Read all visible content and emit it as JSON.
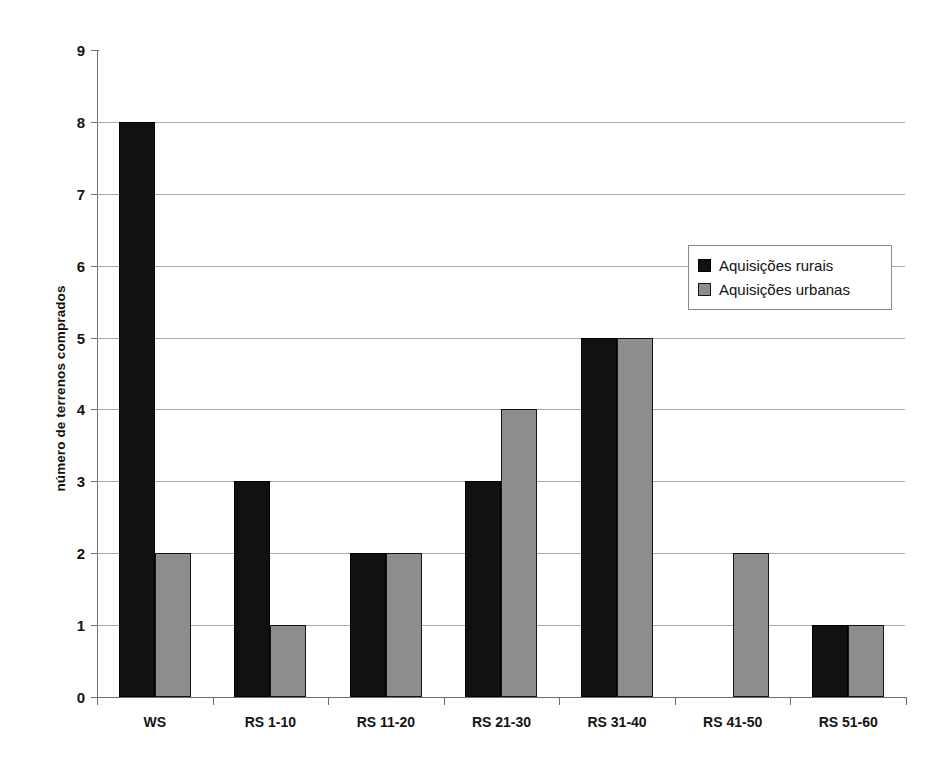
{
  "chart_data": {
    "type": "bar",
    "title": "",
    "xlabel": "",
    "ylabel": "número de terrenos comprados",
    "ylim": [
      0,
      9
    ],
    "ytick_labels": [
      "0",
      "1",
      "2",
      "3",
      "4",
      "5",
      "6",
      "7",
      "8",
      "9"
    ],
    "grid": true,
    "legend_position": "upper right",
    "categories": [
      "WS",
      "RS 1-10",
      "RS 11-20",
      "RS 21-30",
      "RS 31-40",
      "RS 41-50",
      "RS 51-60"
    ],
    "series": [
      {
        "name": "Aquisições rurais",
        "color": "#111111",
        "values": [
          8,
          3,
          2,
          3,
          5,
          0,
          1
        ]
      },
      {
        "name": "Aquisições urbanas",
        "color": "#8d8d8d",
        "values": [
          2,
          1,
          2,
          4,
          5,
          2,
          1
        ]
      }
    ]
  },
  "legend": {
    "items": [
      {
        "label": "Aquisições rurais",
        "swatch": "rural"
      },
      {
        "label": "Aquisições urbanas",
        "swatch": "urban"
      }
    ]
  },
  "colors": {
    "rural": "#111111",
    "urban": "#8d8d8d",
    "gridline": "#a9a9a9",
    "axis": "#6e6e6e",
    "background": "#ffffff"
  }
}
